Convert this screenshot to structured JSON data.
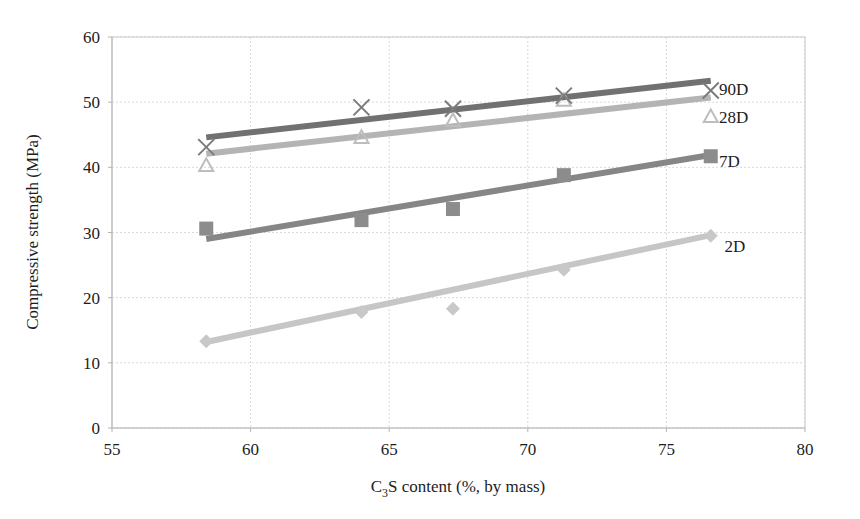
{
  "chart_data": {
    "type": "scatter",
    "title": "",
    "xlabel": "C3S content (%, by mass)",
    "xlabel_parts": {
      "pre": "C",
      "sub": "3",
      "post": "S content (%, by mass)"
    },
    "ylabel": "Compressive strength (MPa)",
    "xlim": [
      55,
      80
    ],
    "ylim": [
      0,
      60
    ],
    "xticks": [
      55,
      60,
      65,
      70,
      75,
      80
    ],
    "yticks": [
      0,
      10,
      20,
      30,
      40,
      50,
      60
    ],
    "grid": true,
    "legend_position": "right-inline-labels",
    "x": [
      58.4,
      64.0,
      67.3,
      71.3,
      76.6
    ],
    "series": [
      {
        "name": "2D",
        "label": "2D",
        "marker": "diamond",
        "color": "#c8c8c8",
        "line_color": "#c6c6c6",
        "values": [
          13.3,
          17.8,
          18.3,
          24.3,
          29.5
        ],
        "trend": {
          "x0": 58.4,
          "y0": 13.2,
          "x1": 76.6,
          "y1": 29.6
        }
      },
      {
        "name": "7D",
        "label": "7D",
        "marker": "square",
        "color": "#8c8c8c",
        "line_color": "#868686",
        "values": [
          30.6,
          31.9,
          33.6,
          38.8,
          41.7
        ],
        "trend": {
          "x0": 58.4,
          "y0": 29.0,
          "x1": 76.6,
          "y1": 41.9
        }
      },
      {
        "name": "28D",
        "label": "28D",
        "marker": "triangle",
        "color": "#bdbdbd",
        "line_color": "#b4b4b4",
        "values": [
          40.3,
          44.6,
          47.2,
          50.3,
          47.8
        ],
        "trend": {
          "x0": 58.4,
          "y0": 42.1,
          "x1": 76.6,
          "y1": 50.7
        }
      },
      {
        "name": "90D",
        "label": "90D",
        "marker": "x",
        "color": "#7b7b7b",
        "line_color": "#717171",
        "values": [
          43.1,
          49.2,
          49.0,
          51.0,
          51.8
        ],
        "trend": {
          "x0": 58.4,
          "y0": 44.6,
          "x1": 76.6,
          "y1": 53.3
        }
      }
    ],
    "annotations": [
      {
        "text": "90D",
        "x": 76.9,
        "y": 52.0
      },
      {
        "text": "28D",
        "x": 76.9,
        "y": 47.7
      },
      {
        "text": "7D",
        "x": 76.9,
        "y": 41.0
      },
      {
        "text": "2D",
        "x": 77.1,
        "y": 28.0
      }
    ]
  },
  "style": {
    "grid_color": "#d9d9d9",
    "frame_color": "#c9c9c9",
    "text_color": "#1d1d1d",
    "background": "#ffffff"
  }
}
